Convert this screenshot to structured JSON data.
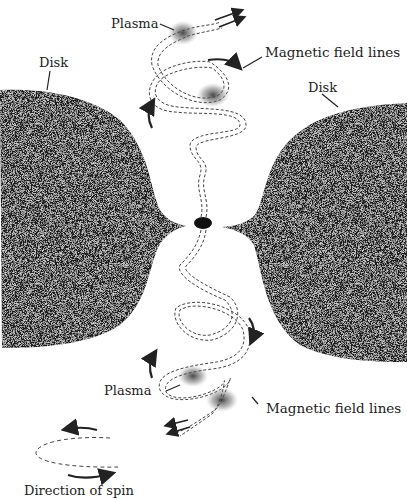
{
  "diagram": {
    "labels": {
      "plasma_top": "Plasma",
      "magnetic_top": "Magnetic field lines",
      "disk_left": "Disk",
      "disk_right": "Disk",
      "plasma_bottom": "Plasma",
      "magnetic_bottom": "Magnetic field lines",
      "spin_legend": "Direction of spin"
    },
    "colors": {
      "disk": "#1c1c1c",
      "line": "#333333",
      "background": "#ffffff"
    }
  }
}
